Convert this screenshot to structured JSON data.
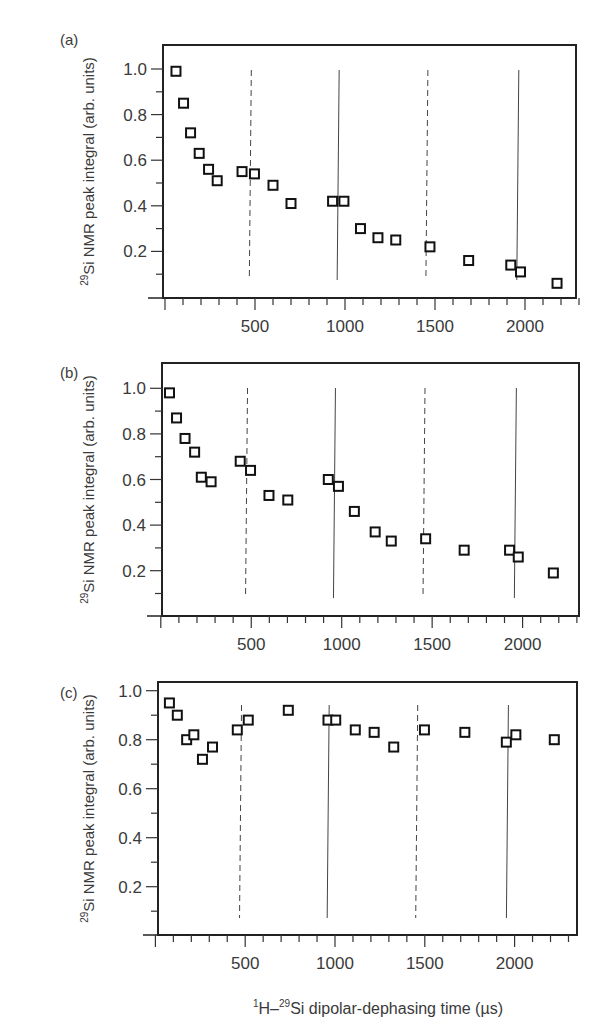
{
  "figure": {
    "x_axis_label": {
      "pre": "1",
      "main1": "H–",
      "sup": "29",
      "main2": "Si dipolar-dephasing time (µs)"
    },
    "y_axis_label": {
      "sup": "29",
      "main": "Si NMR peak integral (arb. units)"
    },
    "x_tick_labels": [
      "500",
      "1000",
      "1500",
      "2000"
    ],
    "y_tick_labels": [
      "0.2",
      "0.4",
      "0.6",
      "0.8",
      "1.0"
    ]
  },
  "chart_data": [
    {
      "panel": "(a)",
      "type": "scatter",
      "title": "",
      "xlabel": "1H–29Si dipolar-dephasing time (µs)",
      "ylabel": "29Si NMR peak integral (arb. units)",
      "xlim": [
        0,
        2300
      ],
      "ylim": [
        0,
        1.1
      ],
      "x_ticks_major": [
        500,
        1000,
        1500,
        2000
      ],
      "x_ticks_minor_step": 100,
      "y_ticks_major": [
        0.2,
        0.4,
        0.6,
        0.8,
        1.0
      ],
      "y_ticks_minor_step": 0.1,
      "grid": false,
      "marker": "open-square",
      "x": [
        61,
        103,
        142,
        190,
        242,
        290,
        428,
        497,
        600,
        700,
        931,
        994,
        1086,
        1183,
        1282,
        1472,
        1687,
        1921,
        1975,
        2178
      ],
      "y": [
        0.99,
        0.85,
        0.72,
        0.63,
        0.56,
        0.51,
        0.55,
        0.54,
        0.49,
        0.41,
        0.42,
        0.42,
        0.3,
        0.26,
        0.25,
        0.22,
        0.16,
        0.14,
        0.11,
        0.06
      ],
      "vertical_lines": [
        {
          "x": 474,
          "style": "dashed"
        },
        {
          "x": 962,
          "style": "solid"
        },
        {
          "x": 1455,
          "style": "dashed"
        },
        {
          "x": 1960,
          "style": "solid"
        }
      ]
    },
    {
      "panel": "(b)",
      "type": "scatter",
      "title": "",
      "xlabel": "1H–29Si dipolar-dephasing time (µs)",
      "ylabel": "29Si NMR peak integral (arb. units)",
      "xlim": [
        0,
        2300
      ],
      "ylim": [
        0,
        1.1
      ],
      "x_ticks_major": [
        500,
        1000,
        1500,
        2000
      ],
      "x_ticks_minor_step": 100,
      "y_ticks_major": [
        0.2,
        0.4,
        0.6,
        0.8,
        1.0
      ],
      "y_ticks_minor_step": 0.1,
      "grid": false,
      "marker": "open-square",
      "x": [
        48,
        87,
        134,
        187,
        224,
        278,
        439,
        496,
        598,
        702,
        926,
        982,
        1070,
        1185,
        1274,
        1464,
        1677,
        1928,
        1976,
        2170
      ],
      "y": [
        0.98,
        0.87,
        0.78,
        0.72,
        0.61,
        0.59,
        0.68,
        0.64,
        0.53,
        0.51,
        0.6,
        0.57,
        0.46,
        0.37,
        0.33,
        0.34,
        0.29,
        0.29,
        0.26,
        0.19
      ],
      "vertical_lines": [
        {
          "x": 474,
          "style": "dashed"
        },
        {
          "x": 960,
          "style": "solid"
        },
        {
          "x": 1455,
          "style": "dashed"
        },
        {
          "x": 1960,
          "style": "solid"
        }
      ]
    },
    {
      "panel": "(c)",
      "type": "scatter",
      "title": "",
      "xlabel": "1H–29Si dipolar-dephasing time (µs)",
      "ylabel": "29Si NMR peak integral (arb. units)",
      "xlim": [
        0,
        2300
      ],
      "ylim": [
        0,
        1.03
      ],
      "x_ticks_major": [
        500,
        1000,
        1500,
        2000
      ],
      "x_ticks_minor_step": 100,
      "y_ticks_major": [
        0.2,
        0.4,
        0.6,
        0.8,
        1.0
      ],
      "y_ticks_minor_step": 0.1,
      "grid": false,
      "marker": "open-square",
      "x": [
        78,
        122,
        174,
        214,
        262,
        318,
        456,
        517,
        740,
        961,
        1004,
        1113,
        1218,
        1327,
        1498,
        1723,
        1954,
        2007,
        2221
      ],
      "y": [
        0.95,
        0.9,
        0.8,
        0.82,
        0.72,
        0.77,
        0.84,
        0.88,
        0.92,
        0.88,
        0.88,
        0.84,
        0.83,
        0.77,
        0.84,
        0.83,
        0.79,
        0.82,
        0.8
      ],
      "vertical_lines": [
        {
          "x": 474,
          "style": "dashed"
        },
        {
          "x": 962,
          "style": "solid"
        },
        {
          "x": 1455,
          "style": "dashed"
        },
        {
          "x": 1960,
          "style": "solid"
        }
      ]
    }
  ]
}
